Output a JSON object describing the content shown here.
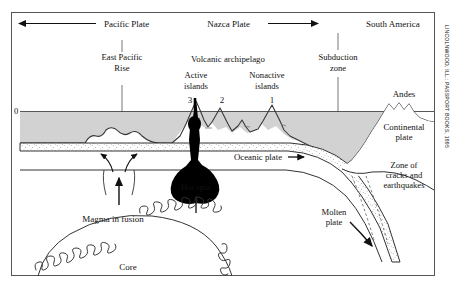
{
  "figure": {
    "type": "geological-cross-section",
    "border_color": "#555555",
    "background": "#ffffff",
    "ocean_fill": "#d2d2d2",
    "plate_fill": "#ffffff",
    "hotspot_fill": "#000000"
  },
  "top_labels": {
    "pacific_plate": "Pacific Plate",
    "nazca_plate": "Nazca Plate",
    "south_america": "South America",
    "east_pacific_rise_line1": "East Pacific",
    "east_pacific_rise_line2": "Rise",
    "subduction_line1": "Subduction",
    "subduction_line2": "zone",
    "volcanic_archipelago": "Volcanic archipelago",
    "active_islands_line1": "Active",
    "active_islands_line2": "islands",
    "nonactive_islands_line1": "Nonactive",
    "nonactive_islands_line2": "islands"
  },
  "island_numbers": [
    "3",
    "2",
    "1"
  ],
  "body_labels": {
    "sea_level": "0",
    "pacific_ocean": "Pacific Ocean",
    "oceanic_plate": "Oceanic plate",
    "hot_spot": "Hot spot",
    "andes": "Andes",
    "continental_plate_line1": "Continental",
    "continental_plate_line2": "plate",
    "zone_line1": "Zone of",
    "zone_line2": "cracks and",
    "zone_line3": "earthquakes",
    "molten_plate_line1": "Molten",
    "molten_plate_line2": "plate",
    "magma_in_fusion": "Magma in fusion",
    "core": "Core"
  },
  "credit": "LINCOLNWOOD, ILL.: PASSPORT BOOKS, 1995"
}
